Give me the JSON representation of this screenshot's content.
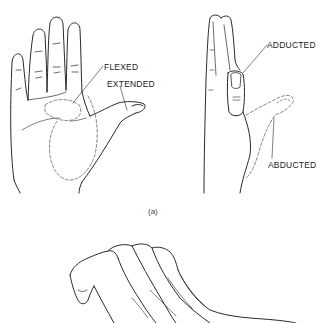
{
  "figure": {
    "caption_a": "(a)",
    "panel_a": {
      "palm_view": {
        "labels": [
          {
            "id": "flexed",
            "text": "FLEXED"
          },
          {
            "id": "extended",
            "text": "EXTENDED"
          }
        ]
      },
      "side_view": {
        "labels": [
          {
            "id": "adducted",
            "text": "ADDUCTED"
          },
          {
            "id": "abducted",
            "text": "ABDUCTED"
          }
        ]
      }
    },
    "panel_b": {
      "description": "hand with fingers flexed (partial view, cropped)"
    },
    "colors": {
      "line": "#2a2a2a",
      "dashed_line": "#666666",
      "background": "#ffffff"
    }
  }
}
